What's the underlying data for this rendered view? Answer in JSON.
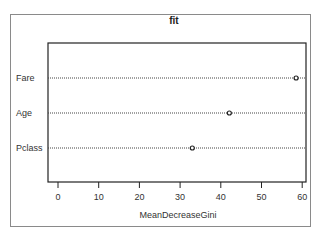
{
  "chart_data": {
    "type": "scatter",
    "subtype": "dotchart",
    "title": "fit",
    "xlabel": "MeanDecreaseGini",
    "ylabel": "",
    "categories": [
      "Fare",
      "Age",
      "Pclass"
    ],
    "values": [
      58.5,
      42.1,
      33.0
    ],
    "xlim": [
      -2,
      61
    ],
    "xticks": [
      0,
      10,
      20,
      30,
      40,
      50,
      60
    ],
    "xtick_labels": [
      "0",
      "10",
      "20",
      "30",
      "40",
      "50",
      "60"
    ],
    "grid": "dotted horizontal lines per category",
    "legend": null
  }
}
